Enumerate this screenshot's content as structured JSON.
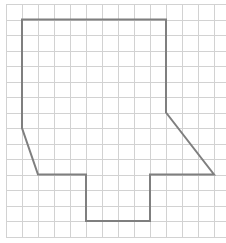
{
  "figure": {
    "width": 226,
    "height": 243,
    "background": "#ffffff"
  },
  "grid": {
    "origin_x": 6,
    "origin_y": 4,
    "cell_w": 16,
    "cell_h": 15.5,
    "cols": 14,
    "rows": 15,
    "line_color": "#d2d2d2",
    "line_width": 1
  },
  "shape": {
    "stroke_color": "#7f7f7f",
    "stroke_width": 2,
    "fill": "none",
    "vertices_grid_units": [
      [
        1,
        1
      ],
      [
        10,
        1
      ],
      [
        10,
        7
      ],
      [
        13,
        11
      ],
      [
        9,
        11
      ],
      [
        9,
        14
      ],
      [
        5,
        14
      ],
      [
        5,
        11
      ],
      [
        2,
        11
      ],
      [
        1,
        8
      ]
    ]
  }
}
